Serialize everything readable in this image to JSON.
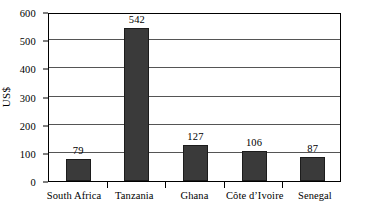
{
  "chart_data": {
    "type": "bar",
    "title": "",
    "xlabel": "",
    "ylabel": "US$",
    "categories": [
      "South Africa",
      "Tanzania",
      "Ghana",
      "Côte d’Ivoire",
      "Senegal"
    ],
    "values": [
      79,
      542,
      127,
      106,
      87
    ],
    "value_labels": [
      "79",
      "542",
      "127",
      "106",
      "87"
    ],
    "ylim": [
      0,
      600
    ],
    "ytick_step": 100,
    "ytick_labels": [
      "0",
      "100",
      "200",
      "300",
      "400",
      "500",
      "600"
    ],
    "ytick_values": [
      0,
      100,
      200,
      300,
      400,
      500,
      600
    ],
    "grid": true,
    "grid_axis": "y",
    "legend": false,
    "legend_position": "none",
    "bar_color": "#3a3a3a",
    "bar_edge_color": "#1c1c1c",
    "gridline_color": "#555555",
    "axis_color": "#000000",
    "background_color": "#ffffff"
  }
}
